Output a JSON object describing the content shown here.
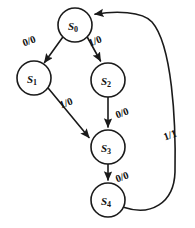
{
  "diagram": {
    "type": "state-transition-diagram",
    "title": "",
    "notation": "input/output",
    "background_color": "#ffffff",
    "stroke_color": "#1a1a1a",
    "states": [
      {
        "id": "S0",
        "label": "S",
        "subscript": "0",
        "cx": 75,
        "cy": 25,
        "r": 17
      },
      {
        "id": "S1",
        "label": "S",
        "subscript": "1",
        "cx": 34,
        "cy": 78,
        "r": 17
      },
      {
        "id": "S2",
        "label": "S",
        "subscript": "2",
        "cx": 108,
        "cy": 80,
        "r": 17
      },
      {
        "id": "S3",
        "label": "S",
        "subscript": "3",
        "cx": 108,
        "cy": 147,
        "r": 17
      },
      {
        "id": "S4",
        "label": "S",
        "subscript": "4",
        "cx": 108,
        "cy": 200,
        "r": 17
      }
    ],
    "transitions": [
      {
        "id": "t0",
        "from": "S0",
        "to": "S1",
        "label": "0/0",
        "label_x": 29,
        "label_y": 41,
        "rotation": -20
      },
      {
        "id": "t1",
        "from": "S0",
        "to": "S2",
        "label": "1/0",
        "label_x": 95,
        "label_y": 41,
        "rotation": -20
      },
      {
        "id": "t2",
        "from": "S1",
        "to": "S3",
        "label": "1/0",
        "label_x": 66,
        "label_y": 103,
        "rotation": -20
      },
      {
        "id": "t3",
        "from": "S2",
        "to": "S3",
        "label": "0/0",
        "label_x": 122,
        "label_y": 113,
        "rotation": -20
      },
      {
        "id": "t4",
        "from": "S3",
        "to": "S4",
        "label": "0/0",
        "label_x": 122,
        "label_y": 177,
        "rotation": -20
      },
      {
        "id": "t5",
        "from": "S4",
        "to": "S0",
        "label": "1/1",
        "label_x": 170,
        "label_y": 135,
        "rotation": -20
      }
    ]
  }
}
